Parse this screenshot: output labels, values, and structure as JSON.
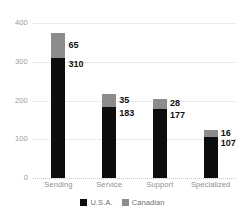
{
  "chart_data": {
    "type": "bar",
    "subtype": "stacked-vertical",
    "title": "",
    "xlabel": "",
    "ylabel": "",
    "ylim": [
      0,
      400
    ],
    "yticks": [
      0,
      100,
      200,
      300,
      400
    ],
    "grid": true,
    "grid_style": "dotted-horizontal",
    "legend_position": "bottom-center",
    "categories": [
      "Sending",
      "Service",
      "Support",
      "Specialized"
    ],
    "series": [
      {
        "name": "U.S.A.",
        "color": "#0d0d0d",
        "values": [
          310,
          183,
          177,
          107
        ]
      },
      {
        "name": "Canadian",
        "color": "#8c8c8c",
        "values": [
          65,
          35,
          28,
          16
        ]
      }
    ],
    "totals": [
      375,
      218,
      205,
      123
    ],
    "data_labels": [
      {
        "category": "Sending",
        "secondary": "65",
        "primary": "310"
      },
      {
        "category": "Service",
        "secondary": "35",
        "primary": "183"
      },
      {
        "category": "Support",
        "secondary": "28",
        "primary": "177"
      },
      {
        "category": "Specialized",
        "secondary": "16",
        "primary": "107"
      }
    ]
  },
  "axis": {
    "y_tick_labels": [
      "400",
      "300",
      "200",
      "100",
      "0"
    ]
  },
  "legend": {
    "items": [
      {
        "label": "U.S.A.",
        "color": "#0d0d0d"
      },
      {
        "label": "Canadian",
        "color": "#8c8c8c"
      }
    ]
  }
}
